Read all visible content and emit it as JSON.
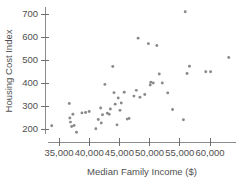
{
  "chart_data": {
    "type": "scatter",
    "title": "",
    "subtitle": "",
    "xlabel": "Median Family Income ($)",
    "ylabel": "Housing Cost Index",
    "xlim": [
      33000,
      64500
    ],
    "ylim": [
      165,
      730
    ],
    "xticks": [
      35000,
      40000,
      45000,
      50000,
      55000,
      60000
    ],
    "xtick_labels": [
      "35,000",
      "40,000",
      "45,000",
      "50,000",
      "55,000",
      "60,000"
    ],
    "yticks": [
      200,
      300,
      400,
      500,
      600,
      700
    ],
    "ytick_labels": [
      "200",
      "300",
      "400",
      "500",
      "600",
      "700"
    ],
    "grid": false,
    "legend": null,
    "point_color": "#8a8a8a",
    "axis_color": "#8c8c8c",
    "text_color": "#4f4f4f",
    "n_points": 51,
    "points": [
      [
        33800,
        214
      ],
      [
        36700,
        311
      ],
      [
        36800,
        248
      ],
      [
        36900,
        230
      ],
      [
        37100,
        211
      ],
      [
        37300,
        264
      ],
      [
        37500,
        215
      ],
      [
        37900,
        186
      ],
      [
        38800,
        270
      ],
      [
        39400,
        272
      ],
      [
        40000,
        276
      ],
      [
        41100,
        201
      ],
      [
        41500,
        241
      ],
      [
        41900,
        291
      ],
      [
        42000,
        226
      ],
      [
        42200,
        262
      ],
      [
        42600,
        394
      ],
      [
        43000,
        269
      ],
      [
        43300,
        264
      ],
      [
        43500,
        287
      ],
      [
        43900,
        472
      ],
      [
        44100,
        358
      ],
      [
        44300,
        308
      ],
      [
        44600,
        218
      ],
      [
        44800,
        335
      ],
      [
        45100,
        281
      ],
      [
        45300,
        313
      ],
      [
        45800,
        360
      ],
      [
        46300,
        243
      ],
      [
        46600,
        246
      ],
      [
        47400,
        343
      ],
      [
        47800,
        368
      ],
      [
        48100,
        595
      ],
      [
        48400,
        338
      ],
      [
        49200,
        350
      ],
      [
        49800,
        571
      ],
      [
        50100,
        391
      ],
      [
        50200,
        403
      ],
      [
        50600,
        400
      ],
      [
        51200,
        563
      ],
      [
        51600,
        439
      ],
      [
        52100,
        400
      ],
      [
        53000,
        357
      ],
      [
        53800,
        285
      ],
      [
        55600,
        240
      ],
      [
        55900,
        710
      ],
      [
        56200,
        441
      ],
      [
        56600,
        473
      ],
      [
        59300,
        449
      ],
      [
        60100,
        449
      ],
      [
        63100,
        511
      ]
    ]
  },
  "axes": {
    "y_title": "Housing Cost Index",
    "x_title": "Median Family Income ($)"
  }
}
